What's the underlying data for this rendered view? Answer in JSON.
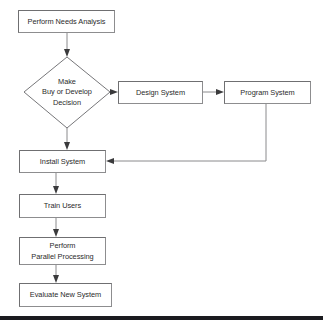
{
  "diagram": {
    "type": "flowchart",
    "colors": {
      "box_fill": "#ffffff",
      "box_border": "#8d8d8f",
      "text": "#2b2b2b",
      "connector": "#8a8a8c",
      "arrowhead": "#3a3a3c",
      "footer_bar": "#1b1b1f"
    },
    "nodes": [
      {
        "id": "perform-needs-analysis",
        "shape": "rectangle",
        "lines": [
          "Perform Needs Analysis"
        ],
        "x": 18,
        "y": 10,
        "w": 97,
        "h": 23
      },
      {
        "id": "make-buy-or-develop-decision",
        "shape": "diamond",
        "lines": [
          "Make",
          "Buy or Develop",
          "Decision"
        ],
        "cx": 67,
        "cy": 92,
        "rx": 43,
        "ry": 36
      },
      {
        "id": "design-system",
        "shape": "rectangle",
        "lines": [
          "Design System"
        ],
        "x": 118,
        "y": 81,
        "w": 85,
        "h": 23
      },
      {
        "id": "program-system",
        "shape": "rectangle",
        "lines": [
          "Program System"
        ],
        "x": 224,
        "y": 81,
        "w": 87,
        "h": 23
      },
      {
        "id": "install-system",
        "shape": "rectangle",
        "lines": [
          "Install System"
        ],
        "x": 19,
        "y": 150,
        "w": 87,
        "h": 23
      },
      {
        "id": "train-users",
        "shape": "rectangle",
        "lines": [
          "Train Users"
        ],
        "x": 19,
        "y": 194,
        "w": 87,
        "h": 24
      },
      {
        "id": "perform-parallel-processing",
        "shape": "rectangle",
        "lines": [
          "Perform",
          "Parallel Processing"
        ],
        "x": 19,
        "y": 237,
        "w": 87,
        "h": 28
      },
      {
        "id": "evaluate-new-system",
        "shape": "rectangle",
        "lines": [
          "Evaluate New System"
        ],
        "x": 19,
        "y": 283,
        "w": 93,
        "h": 24
      }
    ],
    "connectors": [
      {
        "id": "needs-to-decision",
        "from": "perform-needs-analysis",
        "to": "make-buy-or-develop-decision",
        "direction": "down",
        "label": ""
      },
      {
        "id": "decision-to-design",
        "from": "make-buy-or-develop-decision",
        "to": "design-system",
        "direction": "right",
        "label": ""
      },
      {
        "id": "design-to-program",
        "from": "design-system",
        "to": "program-system",
        "direction": "right",
        "label": ""
      },
      {
        "id": "program-to-install",
        "from": "program-system",
        "to": "install-system",
        "direction": "down-left",
        "label": ""
      },
      {
        "id": "decision-to-install",
        "from": "make-buy-or-develop-decision",
        "to": "install-system",
        "direction": "down",
        "label": ""
      },
      {
        "id": "install-to-train",
        "from": "install-system",
        "to": "train-users",
        "direction": "down",
        "label": ""
      },
      {
        "id": "train-to-parallel",
        "from": "train-users",
        "to": "perform-parallel-processing",
        "direction": "down",
        "label": ""
      },
      {
        "id": "parallel-to-evaluate",
        "from": "perform-parallel-processing",
        "to": "evaluate-new-system",
        "direction": "down",
        "label": ""
      }
    ],
    "footer": {
      "visible": true,
      "y": 316,
      "height": 4
    }
  }
}
